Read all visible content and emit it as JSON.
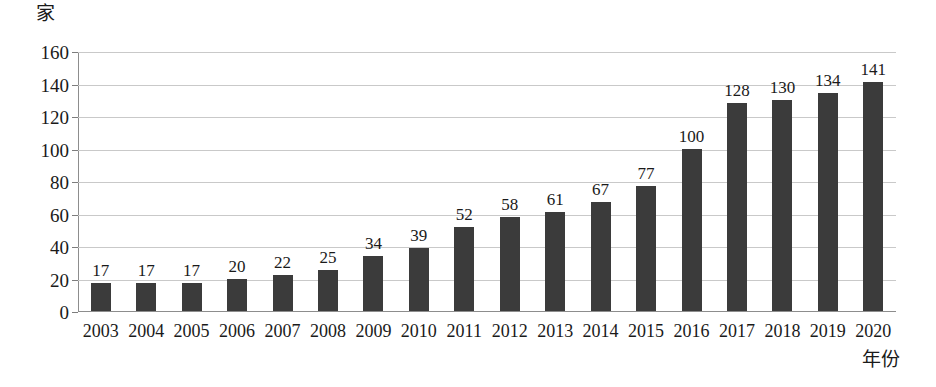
{
  "chart_data": {
    "type": "bar",
    "title": "",
    "xlabel": "年份",
    "ylabel": "家",
    "categories": [
      "2003",
      "2004",
      "2005",
      "2006",
      "2007",
      "2008",
      "2009",
      "2010",
      "2011",
      "2012",
      "2013",
      "2014",
      "2015",
      "2016",
      "2017",
      "2018",
      "2019",
      "2020"
    ],
    "values": [
      17,
      17,
      17,
      20,
      22,
      25,
      34,
      39,
      52,
      58,
      61,
      67,
      77,
      100,
      128,
      130,
      134,
      141
    ],
    "value_labels": [
      "17",
      "17",
      "17",
      "20",
      "22",
      "25",
      "34",
      "39",
      "52",
      "58",
      "61",
      "67",
      "77",
      "100",
      "128",
      "130",
      "134",
      "141"
    ],
    "ylim": [
      0,
      160
    ],
    "ytick_labels": [
      "0",
      "20",
      "40",
      "60",
      "80",
      "100",
      "120",
      "140",
      "160"
    ],
    "ytick_values": [
      0,
      20,
      40,
      60,
      80,
      100,
      120,
      140,
      160
    ],
    "grid": true,
    "legend": "none",
    "bar_color": "#3b3b3b",
    "grid_color": "#c9c9c9",
    "axis_color": "#8d8d8d",
    "background": "#ffffff"
  }
}
